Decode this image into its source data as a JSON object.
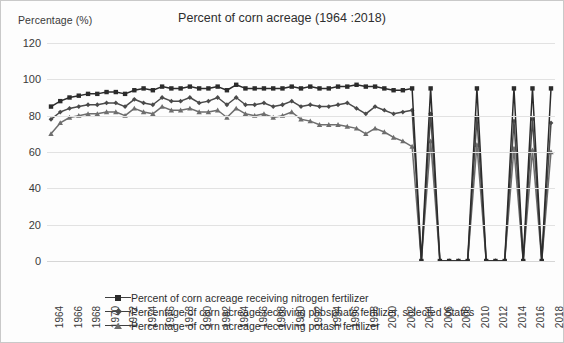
{
  "chart_data": {
    "type": "line",
    "title": "Percent of corn acreage (1964 :2018)",
    "xlabel": "",
    "ylabel": "Percentage (%)",
    "ylim": [
      0,
      120
    ],
    "ytick_values": [
      0,
      20,
      40,
      60,
      80,
      100,
      120
    ],
    "grid": true,
    "legend_position": "bottom",
    "x": [
      1964,
      1965,
      1966,
      1967,
      1968,
      1969,
      1970,
      1971,
      1972,
      1973,
      1974,
      1975,
      1976,
      1977,
      1978,
      1979,
      1980,
      1981,
      1982,
      1983,
      1984,
      1985,
      1986,
      1987,
      1988,
      1989,
      1990,
      1991,
      1992,
      1993,
      1994,
      1995,
      1996,
      1997,
      1998,
      1999,
      2000,
      2001,
      2002,
      2003,
      2004,
      2005,
      2006,
      2007,
      2008,
      2009,
      2010,
      2011,
      2012,
      2013,
      2014,
      2015,
      2016,
      2017,
      2018
    ],
    "xtick_labels": [
      "1964",
      "1966",
      "1968",
      "1970",
      "1972",
      "1974",
      "1976",
      "1978",
      "1980",
      "1982",
      "1984",
      "1986",
      "1988",
      "1990",
      "1992",
      "1994",
      "1996",
      "1998",
      "2000",
      "2002",
      "2004",
      "2006",
      "2008",
      "2010",
      "2012",
      "2014",
      "2016",
      "2018"
    ],
    "series": [
      {
        "name": "Percent of corn acreage receiving nitrogen fertilizer",
        "marker": "square",
        "color": "#2b2b2b",
        "values": [
          85,
          88,
          90,
          91,
          92,
          92,
          93,
          93,
          92,
          94,
          95,
          94,
          96,
          95,
          95,
          96,
          95,
          95,
          96,
          94,
          97,
          95,
          95,
          95,
          95,
          95,
          96,
          95,
          96,
          95,
          95,
          96,
          96,
          97,
          96,
          96,
          95,
          94,
          94,
          95,
          0,
          95,
          0,
          0,
          0,
          0,
          95,
          0,
          0,
          0,
          95,
          0,
          95,
          0,
          95
        ]
      },
      {
        "name": "Percentage of corn acreage receiving phosphate fertilizer, selected States",
        "marker": "diamond",
        "color": "#4a4a4a",
        "values": [
          78,
          82,
          84,
          85,
          86,
          86,
          87,
          87,
          85,
          89,
          87,
          86,
          90,
          88,
          88,
          90,
          87,
          88,
          90,
          86,
          90,
          86,
          86,
          87,
          85,
          86,
          88,
          85,
          86,
          85,
          85,
          86,
          87,
          84,
          81,
          85,
          83,
          81,
          82,
          83,
          0,
          81,
          0,
          0,
          0,
          0,
          79,
          0,
          0,
          0,
          77,
          0,
          78,
          0,
          76
        ]
      },
      {
        "name": "Percentage of corn acreage receiving potash fertilizer",
        "marker": "triangle",
        "color": "#6e6e6e",
        "values": [
          70,
          76,
          79,
          80,
          81,
          81,
          82,
          82,
          80,
          84,
          82,
          81,
          85,
          83,
          83,
          84,
          82,
          82,
          83,
          79,
          84,
          81,
          80,
          81,
          79,
          80,
          82,
          78,
          77,
          75,
          75,
          75,
          74,
          73,
          70,
          73,
          71,
          68,
          66,
          63,
          0,
          66,
          0,
          0,
          0,
          0,
          64,
          0,
          0,
          0,
          62,
          0,
          61,
          0,
          60
        ]
      }
    ]
  },
  "legend": {
    "items": [
      {
        "label": "Percent of corn acreage receiving nitrogen fertilizer"
      },
      {
        "label": "Percentage of corn acreage receiving phosphate fertilizer, selected States"
      },
      {
        "label": "Percentage of corn acreage receiving potash fertilizer"
      }
    ]
  }
}
